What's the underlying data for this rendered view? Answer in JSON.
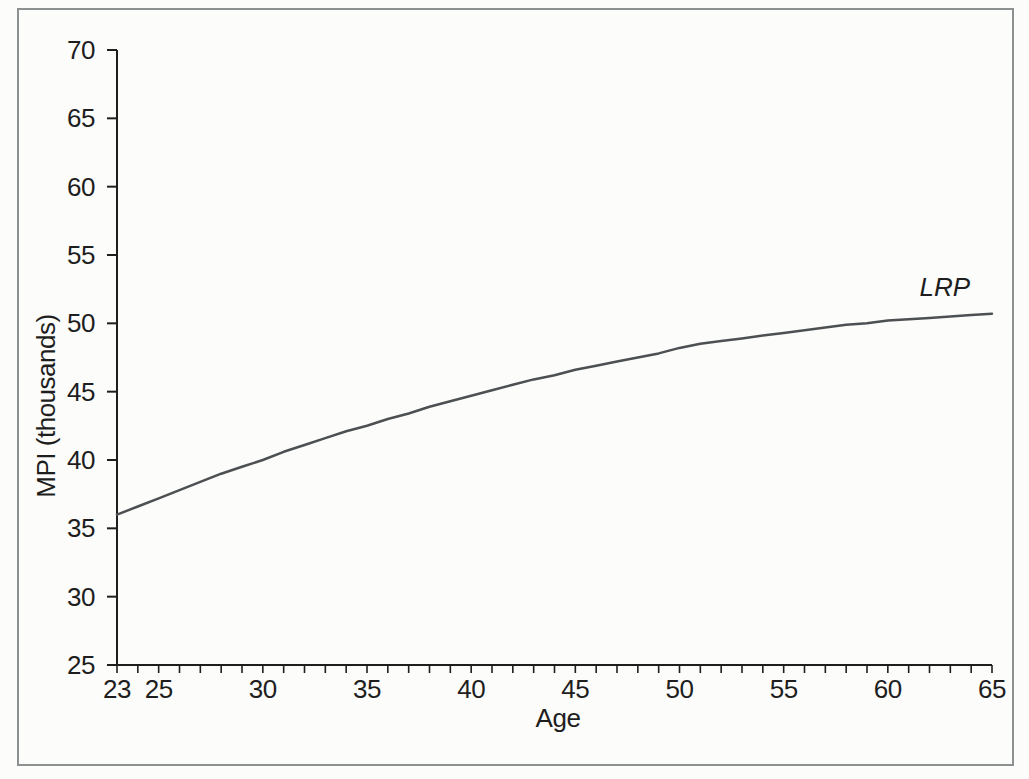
{
  "figure": {
    "background_color": "#fcfcfa",
    "frame_border_color": "#8d9090"
  },
  "chart_data": {
    "type": "line",
    "title": "",
    "xlabel": "Age",
    "ylabel": "MPI (thousands)",
    "xlim": [
      23,
      65
    ],
    "ylim": [
      25,
      70
    ],
    "x_major_ticks": [
      23,
      25,
      30,
      35,
      40,
      45,
      50,
      55,
      60,
      65
    ],
    "x_minor_tick_step": 1,
    "y_ticks": [
      25,
      30,
      35,
      40,
      45,
      50,
      55,
      60,
      65,
      70
    ],
    "grid": "off",
    "legend": "inline-label-at-right-end-of-line",
    "axis_color": "#1e1e1e",
    "text_color": "#1e1e1e",
    "series": [
      {
        "name": "LRP",
        "label_style": "italic",
        "color": "#4d5052",
        "x": [
          23,
          24,
          25,
          26,
          27,
          28,
          29,
          30,
          31,
          32,
          33,
          34,
          35,
          36,
          37,
          38,
          39,
          40,
          41,
          42,
          43,
          44,
          45,
          46,
          47,
          48,
          49,
          50,
          51,
          52,
          53,
          54,
          55,
          56,
          57,
          58,
          59,
          60,
          61,
          62,
          63,
          64,
          65
        ],
        "y": [
          36.0,
          36.6,
          37.2,
          37.8,
          38.4,
          39.0,
          39.5,
          40.0,
          40.6,
          41.1,
          41.6,
          42.1,
          42.5,
          43.0,
          43.4,
          43.9,
          44.3,
          44.7,
          45.1,
          45.5,
          45.9,
          46.2,
          46.6,
          46.9,
          47.2,
          47.5,
          47.8,
          48.2,
          48.5,
          48.7,
          48.9,
          49.1,
          49.3,
          49.5,
          49.7,
          49.9,
          50.0,
          50.2,
          50.3,
          50.4,
          50.5,
          50.6,
          50.7
        ]
      }
    ]
  }
}
